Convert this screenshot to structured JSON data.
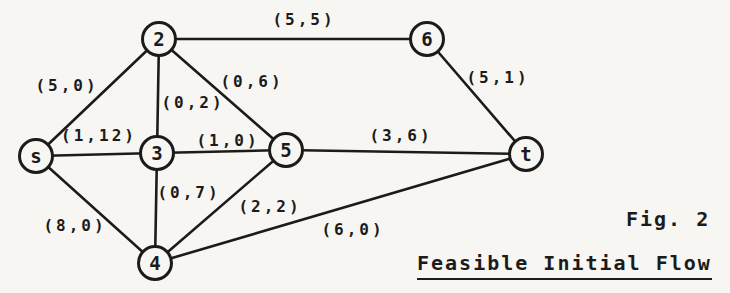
{
  "figure": {
    "caption": "Fig. 2",
    "title": "Feasible Initial Flow"
  },
  "graph": {
    "nodes": [
      {
        "id": "2",
        "label": "2",
        "x": 159,
        "y": 39
      },
      {
        "id": "6",
        "label": "6",
        "x": 427,
        "y": 39
      },
      {
        "id": "s",
        "label": "s",
        "x": 36,
        "y": 156
      },
      {
        "id": "3",
        "label": "3",
        "x": 157,
        "y": 153
      },
      {
        "id": "5",
        "label": "5",
        "x": 286,
        "y": 150
      },
      {
        "id": "t",
        "label": "t",
        "x": 526,
        "y": 154
      },
      {
        "id": "4",
        "label": "4",
        "x": 155,
        "y": 263
      }
    ],
    "edges": [
      {
        "from": "s",
        "to": "2",
        "label": "(5,0)",
        "label_x": 67,
        "label_y": 86
      },
      {
        "from": "s",
        "to": "3",
        "label": "(1,12)",
        "label_x": 99,
        "label_y": 136
      },
      {
        "from": "s",
        "to": "4",
        "label": "(8,0)",
        "label_x": 75,
        "label_y": 226
      },
      {
        "from": "2",
        "to": "3",
        "label": "(0,2)",
        "label_x": 193,
        "label_y": 103
      },
      {
        "from": "2",
        "to": "5",
        "label": "(0,6)",
        "label_x": 252,
        "label_y": 82
      },
      {
        "from": "2",
        "to": "6",
        "label": "(5,5)",
        "label_x": 304,
        "label_y": 20
      },
      {
        "from": "3",
        "to": "5",
        "label": "(1,0)",
        "label_x": 228,
        "label_y": 141
      },
      {
        "from": "3",
        "to": "4",
        "label": "(0,7)",
        "label_x": 189,
        "label_y": 193
      },
      {
        "from": "4",
        "to": "5",
        "label": "(2,2)",
        "label_x": 270,
        "label_y": 207
      },
      {
        "from": "4",
        "to": "t",
        "label": "(6,0)",
        "label_x": 353,
        "label_y": 230
      },
      {
        "from": "5",
        "to": "t",
        "label": "(3,6)",
        "label_x": 401,
        "label_y": 136
      },
      {
        "from": "6",
        "to": "t",
        "label": "(5,1)",
        "label_x": 498,
        "label_y": 78
      }
    ]
  },
  "colors": {
    "ink": "#1b1b1b",
    "paper": "#f7f6f2"
  }
}
